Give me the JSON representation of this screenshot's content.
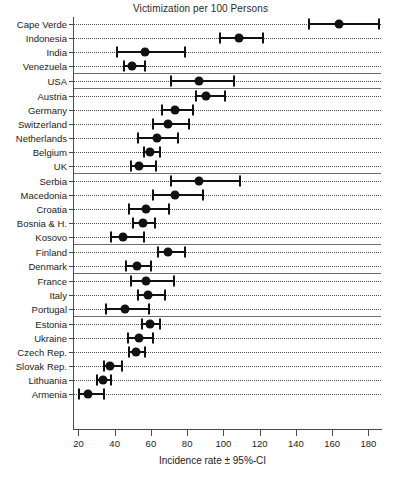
{
  "chart_data": {
    "type": "scatter",
    "title": "Victimization per 100 Persons",
    "xlabel": "Incidence rate ± 95%-CI",
    "ylabel": "",
    "xlim": [
      17,
      187
    ],
    "xticks": [
      20,
      40,
      60,
      80,
      100,
      120,
      140,
      160,
      180
    ],
    "xticklabels": [
      "20",
      "40",
      "60",
      "80",
      "100",
      "120",
      "140",
      "160",
      "180"
    ],
    "grid": "dotted-horizontal-per-row",
    "legend": "none",
    "error_bars": "95% confidence interval",
    "groups": [
      {
        "name": "group-1",
        "points": [
          {
            "label": "Cape Verde",
            "value": 163,
            "low": 146,
            "high": 186
          },
          {
            "label": "Indonesia",
            "value": 108,
            "low": 97,
            "high": 122
          },
          {
            "label": "India",
            "value": 56,
            "low": 40,
            "high": 79
          },
          {
            "label": "Venezuela",
            "value": 49,
            "low": 44,
            "high": 57
          }
        ]
      },
      {
        "name": "group-2",
        "points": [
          {
            "label": "USA",
            "value": 86,
            "low": 70,
            "high": 106
          }
        ]
      },
      {
        "name": "group-3",
        "points": [
          {
            "label": "Austria",
            "value": 90,
            "low": 84,
            "high": 101
          },
          {
            "label": "Germany",
            "value": 73,
            "low": 65,
            "high": 83
          },
          {
            "label": "Switzerland",
            "value": 69,
            "low": 60,
            "high": 81
          },
          {
            "label": "Netherlands",
            "value": 63,
            "low": 52,
            "high": 75
          },
          {
            "label": "Belgium",
            "value": 59,
            "low": 55,
            "high": 65
          },
          {
            "label": "UK",
            "value": 53,
            "low": 48,
            "high": 63
          }
        ]
      },
      {
        "name": "group-4",
        "points": [
          {
            "label": "Serbia",
            "value": 86,
            "low": 70,
            "high": 109
          },
          {
            "label": "Macedonia",
            "value": 73,
            "low": 60,
            "high": 89
          },
          {
            "label": "Croatia",
            "value": 57,
            "low": 47,
            "high": 70
          },
          {
            "label": "Bosnia & H.",
            "value": 55,
            "low": 49,
            "high": 62
          },
          {
            "label": "Kosovo",
            "value": 44,
            "low": 37,
            "high": 56
          }
        ]
      },
      {
        "name": "group-5",
        "points": [
          {
            "label": "Finland",
            "value": 69,
            "low": 63,
            "high": 79
          },
          {
            "label": "Denmark",
            "value": 52,
            "low": 45,
            "high": 60
          }
        ]
      },
      {
        "name": "group-6",
        "points": [
          {
            "label": "France",
            "value": 57,
            "low": 48,
            "high": 73
          },
          {
            "label": "Italy",
            "value": 58,
            "low": 52,
            "high": 68
          },
          {
            "label": "Portugal",
            "value": 45,
            "low": 34,
            "high": 59
          }
        ]
      },
      {
        "name": "group-7",
        "points": [
          {
            "label": "Estonia",
            "value": 59,
            "low": 54,
            "high": 65
          },
          {
            "label": "Ukraine",
            "value": 53,
            "low": 46,
            "high": 61
          },
          {
            "label": "Czech Rep.",
            "value": 51,
            "low": 47,
            "high": 57
          },
          {
            "label": "Slovak Rep.",
            "value": 37,
            "low": 33,
            "high": 44
          },
          {
            "label": "Lithuania",
            "value": 33,
            "low": 29,
            "high": 38
          },
          {
            "label": "Armenia",
            "value": 25,
            "low": 19,
            "high": 34
          }
        ]
      }
    ]
  },
  "colors": {
    "marker": "#111111",
    "axis": "#4a4a4a",
    "grid": "#2f2f2f",
    "separator": "#6e6e6e",
    "background": "#ffffff"
  }
}
